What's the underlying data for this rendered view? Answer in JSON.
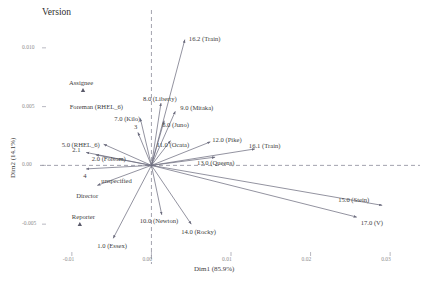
{
  "figure": {
    "title": "Version",
    "background": "#ffffff",
    "text_color": "#3d3d3d",
    "tick_color": "#8d8d8d"
  },
  "chart_data": {
    "type": "scatter",
    "title": "Version",
    "xlabel": "Dim1 (85.9%)",
    "ylabel": "Dim2 (14.1%)",
    "xlim": [
      -0.013,
      0.033
    ],
    "ylim": [
      -0.0072,
      0.0122
    ],
    "xticks": [
      "-0.01",
      "0.00",
      "0.01",
      "0.02",
      "0.03"
    ],
    "xtick_values": [
      -0.01,
      0.0,
      0.01,
      0.02,
      0.03
    ],
    "yticks": [
      "0.010",
      "0.005",
      "0.00",
      "-0.005"
    ],
    "ytick_values": [
      0.01,
      0.005,
      0.0,
      -0.005
    ],
    "grid": false,
    "reference_lines": {
      "horizontal": 0.0,
      "vertical": 0.0,
      "style": "dashed"
    },
    "legend": "none",
    "arrow_origin": [
      0.0,
      0.0
    ],
    "arrows": [
      {
        "label": "16.2 (Train)",
        "x": 0.0042,
        "y": 0.0107
      },
      {
        "label": "8.0 (Liberty)",
        "x": 0.0012,
        "y": 0.0053
      },
      {
        "label": "9.0 (Mitaka)",
        "x": 0.003,
        "y": 0.0046
      },
      {
        "label": "7.0 (Kilo)",
        "x": -0.0014,
        "y": 0.004
      },
      {
        "label": "6.0 (Juno)",
        "x": 0.0016,
        "y": 0.0038
      },
      {
        "label": "3",
        "x": -0.0017,
        "y": 0.0028
      },
      {
        "label": "11.0 (Ocata)",
        "x": 0.0024,
        "y": 0.0021
      },
      {
        "label": "12.0 (Pike)",
        "x": 0.0074,
        "y": 0.002
      },
      {
        "label": "5.0 (RHEL_6)",
        "x": -0.006,
        "y": 0.0018
      },
      {
        "label": "2.1",
        "x": -0.0082,
        "y": 0.0011
      },
      {
        "label": "2.0 (Folsom)",
        "x": -0.007,
        "y": 0.0009
      },
      {
        "label": "13.0 (Queens)",
        "x": 0.008,
        "y": 0.0007
      },
      {
        "label": "16.1 (Train)",
        "x": 0.013,
        "y": 0.0014
      },
      {
        "label": "4",
        "x": -0.0082,
        "y": -0.0003
      },
      {
        "label": "unspecified",
        "x": -0.0068,
        "y": -0.0017
      },
      {
        "label": "15.0 (Stein)",
        "x": 0.029,
        "y": -0.0034
      },
      {
        "label": "10.0 (Newton)",
        "x": 0.0013,
        "y": -0.0042
      },
      {
        "label": "14.0 (Rocky)",
        "x": 0.005,
        "y": -0.005
      },
      {
        "label": "1.0 (Essex)",
        "x": -0.0048,
        "y": -0.0062
      },
      {
        "label": "17.0 (V)",
        "x": 0.0258,
        "y": -0.0044
      }
    ],
    "points": [
      {
        "label": "Assignee",
        "x": -0.0086,
        "y": 0.0064,
        "marker": "triangle"
      },
      {
        "label": "Foreman (RHEL_6)",
        "x": -0.006,
        "y": 0.0052,
        "marker": "none"
      },
      {
        "label": "Director",
        "x": -0.0072,
        "y": -0.0022,
        "marker": "none"
      },
      {
        "label": "Reporter",
        "x": -0.009,
        "y": -0.005,
        "marker": "triangle"
      }
    ],
    "labels": {
      "group_markers": [
        "Assignee",
        "Reporter"
      ],
      "row_labels": [
        "Foreman (RHEL_6)",
        "Director"
      ]
    }
  }
}
